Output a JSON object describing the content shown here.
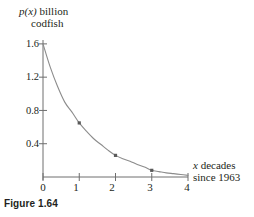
{
  "figure": {
    "caption": "Figure 1.64",
    "y_axis_title_line1_math": "p(x)",
    "y_axis_title_line1_rest": " billion",
    "y_axis_title_line2": "codfish",
    "x_axis_title_line1_math": "x",
    "x_axis_title_line1_rest": " decades",
    "x_axis_title_line2": "since 1963"
  },
  "chart_data": {
    "type": "line",
    "title": "",
    "subtitle": "",
    "xlabel": "x decades since 1963",
    "ylabel": "p(x) billion codfish",
    "xlim": [
      0,
      4
    ],
    "ylim": [
      0,
      1.75
    ],
    "grid": false,
    "legend": null,
    "xticks": [
      0,
      1,
      2,
      3,
      4
    ],
    "xtick_labels": [
      "0",
      "1",
      "2",
      "3",
      "4"
    ],
    "yticks": [
      0.4,
      0.8,
      1.2,
      1.6
    ],
    "ytick_labels": [
      "0.4",
      "0.8",
      "1.2",
      "1.6"
    ],
    "curve_color": "#8c8c8c",
    "axis_color": "#6e6e6e",
    "marker_color": "#5a5a5a",
    "series": [
      {
        "name": "p(x) exponential decay curve",
        "type": "line",
        "x": [
          0,
          0.2,
          0.4,
          0.6,
          0.8,
          1.0,
          1.2,
          1.4,
          1.6,
          1.8,
          2.0,
          2.2,
          2.4,
          2.6,
          2.8,
          3.0,
          3.2,
          3.4,
          3.6,
          3.8,
          4.0
        ],
        "y": [
          1.6,
          1.32,
          1.09,
          0.9,
          0.78,
          0.65,
          0.55,
          0.46,
          0.39,
          0.32,
          0.26,
          0.22,
          0.19,
          0.15,
          0.12,
          0.08,
          0.065,
          0.05,
          0.04,
          0.03,
          0.02
        ]
      },
      {
        "name": "plotted data points",
        "type": "scatter",
        "x": [
          1,
          2,
          3
        ],
        "y": [
          0.65,
          0.26,
          0.08
        ]
      }
    ]
  }
}
